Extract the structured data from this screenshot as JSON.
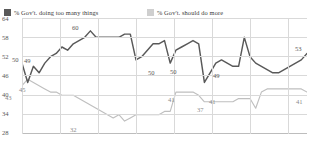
{
  "legend": {
    "items": [
      {
        "label": "% Gov't. doing too many things",
        "color": "#595959"
      },
      {
        "label": "% Gov't. should do more",
        "color": "#bfbfbf"
      }
    ]
  },
  "axis": {
    "y_ticks": [
      "64",
      "58",
      "52",
      "46",
      "40",
      "34",
      "28"
    ]
  },
  "annotations": {
    "a_50": "50",
    "a_49": "49",
    "a_45": "45",
    "a_43": "43",
    "a_60": "60",
    "a_32": "32",
    "a_50b": "50",
    "a_50c": "50",
    "a_41a": "41",
    "a_37": "37",
    "a_49b": "49",
    "a_41b": "41",
    "a_53": "53",
    "a_41c": "41"
  },
  "chart_data": {
    "type": "line",
    "title": "",
    "xlabel": "",
    "ylabel": "",
    "ylim": [
      28,
      64
    ],
    "yticks": [
      28,
      34,
      40,
      46,
      52,
      58,
      64
    ],
    "grid": true,
    "legend_position": "top-left",
    "series": [
      {
        "name": "% Gov't. doing too many things",
        "color": "#595959",
        "labeled_points": [
          {
            "index": 0,
            "value": 50
          },
          {
            "index": 2,
            "value": 49
          },
          {
            "index": 12,
            "value": 60
          },
          {
            "index": 26,
            "value": 50
          },
          {
            "index": 29,
            "value": 50
          },
          {
            "index": 38,
            "value": 49
          },
          {
            "index": 50,
            "value": 53
          }
        ],
        "values": [
          50,
          44,
          49,
          47,
          50,
          52,
          53,
          55,
          54,
          56,
          57,
          58,
          60,
          58,
          58,
          58,
          58,
          58,
          59,
          59,
          51,
          52,
          54,
          56,
          56,
          57,
          50,
          54,
          55,
          56,
          57,
          56,
          44,
          47,
          50,
          51,
          50,
          49,
          49,
          58,
          52,
          50,
          49,
          48,
          47,
          47,
          48,
          49,
          50,
          51,
          53
        ]
      },
      {
        "name": "% Gov't. should do more",
        "color": "#bfbfbf",
        "labeled_points": [
          {
            "index": 1,
            "value": 45
          },
          {
            "index": 0,
            "value": 43
          },
          {
            "index": 12,
            "value": 32
          },
          {
            "index": 27,
            "value": 41
          },
          {
            "index": 33,
            "value": 37
          },
          {
            "index": 40,
            "value": 41
          },
          {
            "index": 50,
            "value": 41
          }
        ],
        "values": [
          43,
          45,
          44,
          43,
          42,
          41,
          41,
          40,
          40,
          40,
          39,
          38,
          37,
          36,
          35,
          34,
          33,
          34,
          32,
          33,
          34,
          34,
          34,
          34,
          34,
          35,
          35,
          41,
          41,
          41,
          41,
          40,
          38,
          38,
          38,
          38,
          38,
          38,
          39,
          39,
          39,
          36,
          41,
          42,
          42,
          42,
          42,
          42,
          42,
          42,
          41
        ]
      }
    ]
  }
}
